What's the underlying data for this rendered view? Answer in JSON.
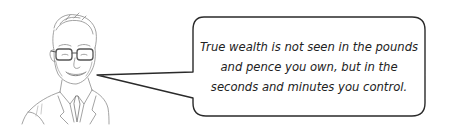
{
  "illustration": {
    "subject": "sketch-portrait-man-with-glasses",
    "stroke_color": "#8a8a8a"
  },
  "speech_bubble": {
    "text": "True wealth is not seen in the pounds and pence you own, but in the seconds and minutes you control.",
    "border_color": "#2a2a2a",
    "fill_color": "#ffffff"
  }
}
